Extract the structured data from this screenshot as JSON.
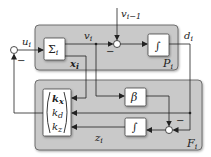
{
  "diagram": {
    "colors": {
      "panel_fill": "#c9c9c9",
      "panel_stroke": "#555555",
      "block_fill": "#ffffff",
      "line": "#222222"
    },
    "panels": {
      "top": {
        "label": "P",
        "sub": "i"
      },
      "bottom": {
        "label": "F",
        "sub": "i"
      }
    },
    "blocks": {
      "sigma": {
        "label": "Σ",
        "sub": "i"
      },
      "integrator_top": {
        "label": "∫"
      },
      "beta": {
        "label": "β"
      },
      "integrator_bottom": {
        "label": "∫"
      },
      "gain_vector": {
        "rows": [
          "k",
          "k",
          "k"
        ],
        "subs": [
          "x",
          "d",
          "z"
        ]
      }
    },
    "signals": {
      "u": {
        "label": "u",
        "sub": "i"
      },
      "v": {
        "label": "v",
        "sub": "i"
      },
      "v_prev": {
        "label": "v",
        "sub": "i−1"
      },
      "d": {
        "label": "d",
        "sub": "i"
      },
      "x": {
        "label": "x",
        "sub": "i"
      },
      "z": {
        "label": "z",
        "sub": "i"
      }
    },
    "signs": {
      "input_sum_minus": "−",
      "top_sum_minus": "−",
      "bottom_sum_minus": "−"
    }
  }
}
